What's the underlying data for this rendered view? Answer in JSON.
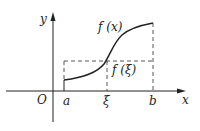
{
  "diagram": {
    "axes": {
      "x_label": "x",
      "y_label": "y",
      "origin_label": "O"
    },
    "curve_label": "f (x)",
    "mean_value_label": "f (ξ)",
    "x_ticks": [
      {
        "id": "a",
        "label": "a"
      },
      {
        "id": "xi",
        "label": "ξ"
      },
      {
        "id": "b",
        "label": "b"
      }
    ],
    "colors": {
      "line": "#222222",
      "dashed": "#444444",
      "background": "#ffffff"
    }
  }
}
